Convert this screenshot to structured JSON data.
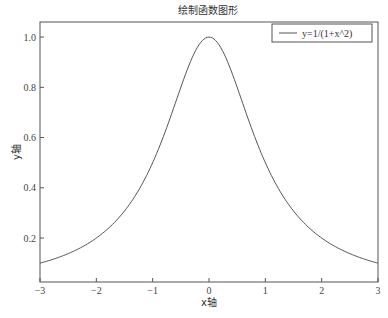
{
  "chart_data": {
    "type": "line",
    "title": "绘制函数图形",
    "xlabel": "x轴",
    "ylabel": "y轴",
    "xlim": [
      -3,
      3
    ],
    "ylim": [
      0.025,
      1.06
    ],
    "xticks": [
      -3,
      -2,
      -1,
      0,
      1,
      2,
      3
    ],
    "xtick_labels": [
      "−3",
      "−2",
      "−1",
      "0",
      "1",
      "2",
      "3"
    ],
    "yticks": [
      0.2,
      0.4,
      0.6,
      0.8,
      1.0
    ],
    "ytick_labels": [
      "0.2",
      "0.4",
      "0.6",
      "0.8",
      "1.0"
    ],
    "grid": false,
    "legend_position": "upper right",
    "series": [
      {
        "name": "y=1/(1+x^2)",
        "color": "#555555",
        "function": "1/(1+x^2)",
        "x": [
          -3,
          -2.5,
          -2,
          -1.5,
          -1,
          -0.5,
          0,
          0.5,
          1,
          1.5,
          2,
          2.5,
          3
        ],
        "values": [
          0.1,
          0.138,
          0.2,
          0.308,
          0.5,
          0.8,
          1.0,
          0.8,
          0.5,
          0.308,
          0.2,
          0.138,
          0.1
        ]
      }
    ]
  }
}
